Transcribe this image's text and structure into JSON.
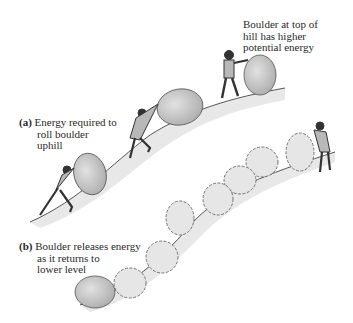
{
  "figure": {
    "type": "illustration",
    "colors": {
      "background": "#ffffff",
      "ink": "#2a2a2a",
      "boulder_fill": "#c9c9c9",
      "boulder_ghost_fill": "#e6e6e6",
      "hill_shadow": "#dcdcdc"
    }
  },
  "labels": {
    "top": {
      "lines": [
        "Boulder at top of",
        "hill has higher",
        "potential energy"
      ]
    },
    "a": {
      "tag": "(a)",
      "lines": [
        "Energy required to",
        "roll boulder",
        "uphill"
      ]
    },
    "b": {
      "tag": "(b)",
      "lines": [
        "Boulder releases energy",
        "as it returns to",
        "lower level"
      ]
    }
  }
}
